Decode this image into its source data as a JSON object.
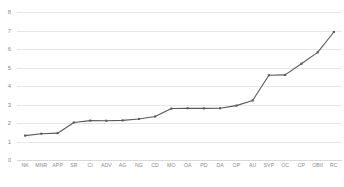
{
  "chart_data": {
    "type": "line",
    "title": "",
    "subtitle": "",
    "xlabel": "",
    "ylabel": "",
    "ylim": [
      0,
      8
    ],
    "yticks": [
      0,
      1,
      2,
      3,
      4,
      5,
      6,
      7,
      8
    ],
    "ytick_labels": [
      "0",
      "1",
      "2",
      "3",
      "4",
      "5",
      "6",
      "7",
      "8"
    ],
    "grid": "horizontal",
    "legend": "none",
    "line_color": "#595959",
    "marker_color": "#595959",
    "marker": "square",
    "background_color": "#ffffff",
    "gridline_color": "#e6e6e6",
    "tick_label_color": "#8a8a8a",
    "categories": [
      "NK",
      "MNR",
      "APP",
      "SR",
      "CI",
      "ADV",
      "AG",
      "NG",
      "CD",
      "MO",
      "OA",
      "PD",
      "DA",
      "OP",
      "AU",
      "SVP",
      "OC",
      "CP",
      "OBII",
      "RC"
    ],
    "values": [
      1.32,
      1.42,
      1.45,
      2.03,
      2.13,
      2.12,
      2.14,
      2.22,
      2.35,
      2.78,
      2.8,
      2.79,
      2.8,
      2.94,
      3.22,
      4.58,
      4.6,
      5.2,
      5.82,
      6.92
    ],
    "series": [
      {
        "name": "",
        "values": [
          1.32,
          1.42,
          1.45,
          2.03,
          2.13,
          2.12,
          2.14,
          2.22,
          2.35,
          2.78,
          2.8,
          2.79,
          2.8,
          2.94,
          3.22,
          4.58,
          4.6,
          5.2,
          5.82,
          6.92
        ]
      }
    ]
  }
}
